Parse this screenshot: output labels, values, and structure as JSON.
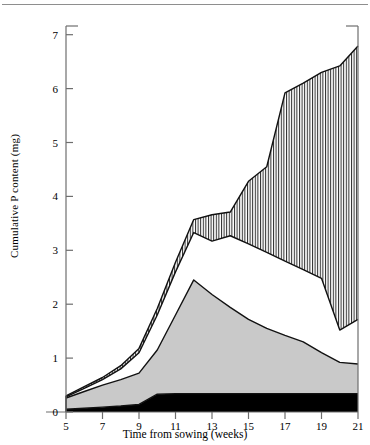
{
  "chart_data": {
    "type": "area",
    "title": "",
    "xlabel": "Time from sowing (weeks)",
    "ylabel": "Cumulative P content (mg)",
    "xlim": [
      4,
      21
    ],
    "ylim": [
      0,
      7.4
    ],
    "xticks": [
      "5",
      "7",
      "9",
      "11",
      "13",
      "15",
      "17",
      "19",
      "21"
    ],
    "xtick_values": [
      5,
      7,
      9,
      11,
      13,
      15,
      17,
      19,
      21
    ],
    "yticks": [
      "0",
      "1",
      "2",
      "3",
      "4",
      "5",
      "6",
      "7"
    ],
    "ytick_values": [
      0,
      1,
      2,
      3,
      4,
      5,
      6,
      7
    ],
    "grid": false,
    "legend": "none",
    "stacked": true,
    "x": [
      5,
      6,
      7,
      8,
      9,
      10,
      11,
      12,
      13,
      14,
      15,
      16,
      17,
      18,
      19,
      20,
      21
    ],
    "series": [
      {
        "name": "band-1-black",
        "fill": "#000000",
        "hatch": "solid",
        "cumulative_top": [
          0.05,
          0.07,
          0.09,
          0.11,
          0.14,
          0.33,
          0.34,
          0.34,
          0.34,
          0.34,
          0.34,
          0.34,
          0.34,
          0.34,
          0.34,
          0.34,
          0.34
        ]
      },
      {
        "name": "band-2-grey",
        "fill": "#c9c9c9",
        "hatch": "solid",
        "cumulative_top": [
          0.26,
          0.38,
          0.5,
          0.6,
          0.72,
          1.15,
          1.8,
          2.45,
          2.18,
          1.94,
          1.72,
          1.55,
          1.42,
          1.3,
          1.1,
          0.92,
          0.89
        ]
      },
      {
        "name": "band-3-white-gap",
        "fill": "#ffffff",
        "hatch": "none",
        "cumulative_top": [
          0.28,
          0.44,
          0.6,
          0.8,
          1.1,
          1.8,
          2.6,
          3.33,
          3.17,
          3.27,
          3.12,
          2.96,
          2.8,
          2.64,
          2.48,
          1.52,
          1.72
        ]
      },
      {
        "name": "band-4-vertical-hatch",
        "fill": "#ffffff",
        "hatch": "vertical-lines",
        "cumulative_top": [
          0.3,
          0.47,
          0.64,
          0.86,
          1.18,
          1.92,
          2.78,
          3.57,
          3.66,
          3.71,
          4.28,
          4.55,
          5.92,
          6.1,
          6.3,
          6.42,
          6.79
        ]
      }
    ]
  },
  "axis": {
    "y_title": "Cumulative P content (mg)",
    "x_title": "Time from sowing (weeks)"
  }
}
